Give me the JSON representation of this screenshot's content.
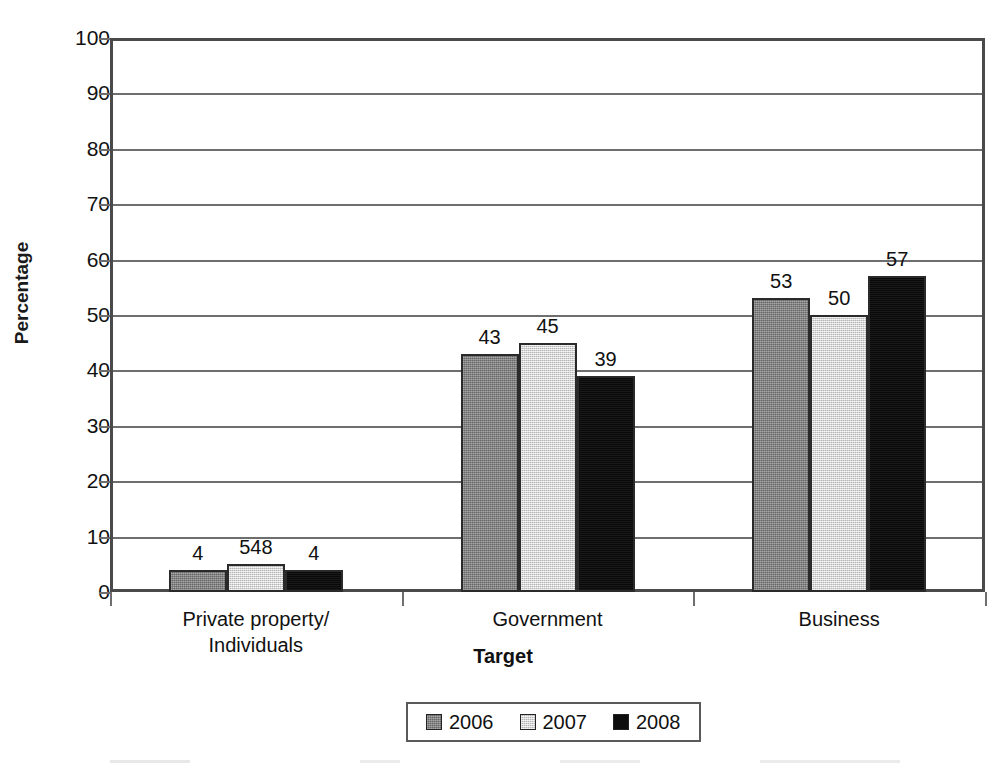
{
  "chart_data": {
    "type": "bar",
    "title": "",
    "xlabel": "Target",
    "ylabel": "Percentage",
    "ylim": [
      0,
      100
    ],
    "ytick_step": 10,
    "yticks": [
      100,
      90,
      80,
      70,
      60,
      50,
      40,
      30,
      20,
      10,
      0
    ],
    "grid": true,
    "legend_position": "bottom",
    "categories": [
      "Private property/\nIndividuals",
      "Government",
      "Business"
    ],
    "category_lines": [
      [
        "Private property/",
        "Individuals"
      ],
      [
        "Government"
      ],
      [
        "Business"
      ]
    ],
    "series": [
      {
        "name": "2006",
        "color": "#838383",
        "values": [
          4,
          43,
          53
        ],
        "labels": [
          "4",
          "43",
          "53"
        ]
      },
      {
        "name": "2007",
        "color": "#dcdcdc",
        "values": [
          5,
          45,
          50
        ],
        "labels": [
          "548",
          "45",
          "50"
        ]
      },
      {
        "name": "2008",
        "color": "#0d0d0d",
        "values": [
          4,
          39,
          57
        ],
        "labels": [
          "4",
          "39",
          "57"
        ]
      }
    ]
  },
  "axis": {
    "y_title": "Percentage",
    "x_title": "Target",
    "tick_labels": [
      "100",
      "90",
      "80",
      "70",
      "60",
      "50",
      "40",
      "30",
      "20",
      "10",
      "0"
    ]
  },
  "legend": {
    "entries": [
      {
        "label": "2006",
        "swatch": "dark-gray-swatch"
      },
      {
        "label": "2007",
        "swatch": "light-gray-swatch"
      },
      {
        "label": "2008",
        "swatch": "black-swatch"
      }
    ]
  },
  "colors": {
    "series_2006": "#838383",
    "series_2007": "#dcdcdc",
    "series_2008": "#0d0d0d",
    "axis": "#4a4a4a",
    "gridline": "#6e6e6e",
    "text": "#111111",
    "background": "#ffffff"
  }
}
